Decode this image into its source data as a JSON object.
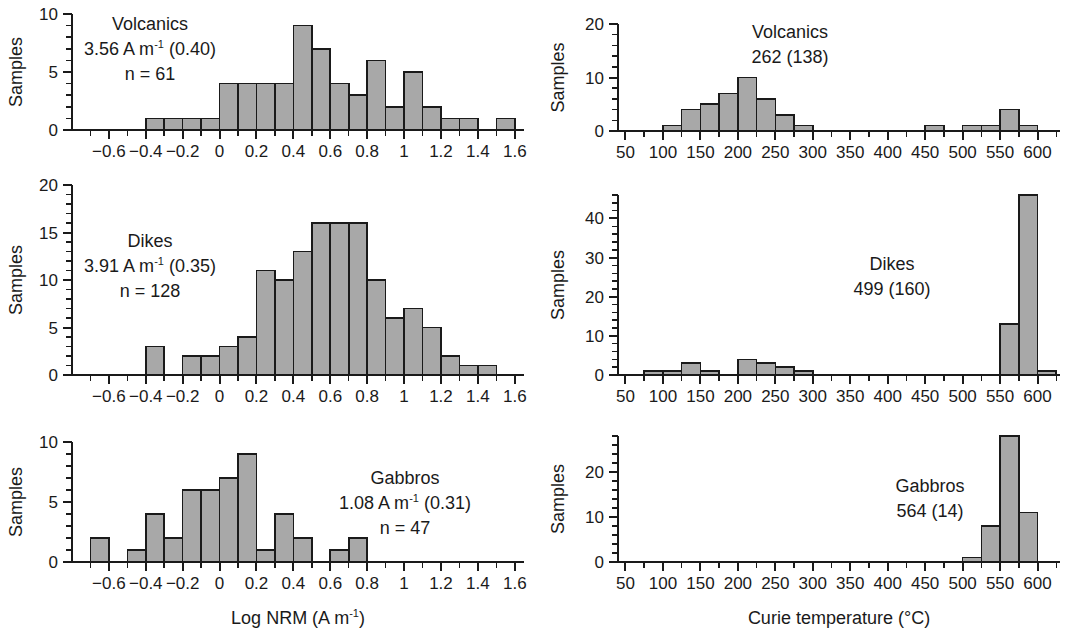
{
  "figure": {
    "background_color": "#ffffff",
    "bar_fill_color": "#a8a8a8",
    "bar_stroke_color": "#1a1a1a",
    "axis_color": "#1a1a1a"
  },
  "axis_titles": {
    "left_column": "Log NRM (A m",
    "left_column_sup": "-1",
    "left_column_tail": ")",
    "right_column": "Curie temperature (°C)",
    "y_axis": "Samples"
  },
  "chart_data": [
    {
      "id": "volcanics-nrm",
      "type": "bar",
      "title": "",
      "xlabel": "Log NRM (A m-1)",
      "ylabel": "Samples",
      "xlim": [
        -0.8,
        1.65
      ],
      "ylim": [
        0,
        10
      ],
      "yticks": [
        0,
        5,
        10
      ],
      "ytick_labels": [
        "0",
        "5",
        "10"
      ],
      "xticks": [
        -0.6,
        -0.4,
        -0.2,
        0,
        0.2,
        0.4,
        0.6,
        0.8,
        1.0,
        1.2,
        1.4,
        1.6
      ],
      "xtick_labels": [
        "−0.6",
        "−0.4",
        "−0.2",
        "0",
        "0.2",
        "0.4",
        "0.6",
        "0.8",
        "1",
        "1.2",
        "1.4",
        "1.6"
      ],
      "minor_tick_step": 0.1,
      "bin_width": 0.1,
      "bin_starts": [
        -0.4,
        -0.3,
        -0.2,
        -0.1,
        0.0,
        0.1,
        0.2,
        0.3,
        0.4,
        0.5,
        0.6,
        0.7,
        0.8,
        0.9,
        1.0,
        1.1,
        1.2,
        1.3,
        1.5
      ],
      "values": [
        1,
        1,
        1,
        1,
        4,
        4,
        4,
        4,
        9,
        7,
        4,
        3,
        6,
        2,
        5,
        2,
        1,
        1,
        1
      ],
      "annotation": {
        "line1": "Volcanics",
        "line2_pre": "3.56 A m",
        "line2_sup": "-1",
        "line2_post": " (0.40)",
        "line3": "n = 61"
      },
      "grid": false,
      "legend": "none"
    },
    {
      "id": "volcanics-curie",
      "type": "bar",
      "title": "",
      "xlabel": "Curie temperature (°C)",
      "ylabel": "Samples",
      "xlim": [
        40,
        630
      ],
      "ylim": [
        0,
        20
      ],
      "yticks": [
        0,
        10,
        20
      ],
      "ytick_labels": [
        "0",
        "10",
        "20"
      ],
      "xticks": [
        50,
        100,
        150,
        200,
        250,
        300,
        350,
        400,
        450,
        500,
        550,
        600
      ],
      "xtick_labels": [
        "50",
        "100",
        "150",
        "200",
        "250",
        "300",
        "350",
        "400",
        "450",
        "500",
        "550",
        "600"
      ],
      "minor_tick_step": 25,
      "bin_width": 25,
      "bin_starts": [
        100,
        125,
        150,
        175,
        200,
        225,
        250,
        275,
        450,
        500,
        525,
        550,
        575
      ],
      "values": [
        1,
        4,
        5,
        7,
        10,
        6,
        3,
        1,
        1,
        1,
        1,
        4,
        1
      ],
      "annotation": {
        "line1": "Volcanics",
        "line2": "262 (138)"
      },
      "grid": false,
      "legend": "none"
    },
    {
      "id": "dikes-nrm",
      "type": "bar",
      "title": "",
      "xlabel": "Log NRM (A m-1)",
      "ylabel": "Samples",
      "xlim": [
        -0.8,
        1.65
      ],
      "ylim": [
        0,
        20
      ],
      "yticks": [
        0,
        5,
        10,
        15,
        20
      ],
      "ytick_labels": [
        "0",
        "5",
        "10",
        "15",
        "20"
      ],
      "xticks": [
        -0.6,
        -0.4,
        -0.2,
        0,
        0.2,
        0.4,
        0.6,
        0.8,
        1.0,
        1.2,
        1.4,
        1.6
      ],
      "xtick_labels": [
        "−0.6",
        "−0.4",
        "−0.2",
        "0",
        "0.2",
        "0.4",
        "0.6",
        "0.8",
        "1",
        "1.2",
        "1.4",
        "1.6"
      ],
      "minor_tick_step": 0.1,
      "bin_width": 0.1,
      "bin_starts": [
        -0.4,
        -0.2,
        -0.1,
        0.0,
        0.1,
        0.2,
        0.3,
        0.4,
        0.5,
        0.6,
        0.7,
        0.8,
        0.9,
        1.0,
        1.1,
        1.2,
        1.3,
        1.4
      ],
      "values": [
        3,
        2,
        2,
        3,
        4,
        11,
        10,
        13,
        16,
        16,
        16,
        10,
        6,
        7,
        5,
        2,
        1,
        1
      ],
      "annotation": {
        "line1": "Dikes",
        "line2_pre": "3.91 A m",
        "line2_sup": "-1",
        "line2_post": " (0.35)",
        "line3": "n = 128"
      },
      "grid": false,
      "legend": "none"
    },
    {
      "id": "dikes-curie",
      "type": "bar",
      "title": "",
      "xlabel": "Curie temperature (°C)",
      "ylabel": "Samples",
      "xlim": [
        40,
        630
      ],
      "ylim": [
        0,
        46
      ],
      "yticks": [
        0,
        10,
        20,
        30,
        40
      ],
      "ytick_labels": [
        "0",
        "10",
        "20",
        "30",
        "40"
      ],
      "xticks": [
        50,
        100,
        150,
        200,
        250,
        300,
        350,
        400,
        450,
        500,
        550,
        600
      ],
      "xtick_labels": [
        "50",
        "100",
        "150",
        "200",
        "250",
        "300",
        "350",
        "400",
        "450",
        "500",
        "550",
        "600"
      ],
      "minor_tick_step": 25,
      "bin_width": 25,
      "bin_starts": [
        75,
        100,
        125,
        150,
        200,
        225,
        250,
        275,
        550,
        575,
        600
      ],
      "values": [
        1,
        1,
        3,
        1,
        4,
        3,
        2,
        1,
        13,
        46,
        1
      ],
      "annotation": {
        "line1": "Dikes",
        "line2": "499 (160)"
      },
      "grid": false,
      "legend": "none"
    },
    {
      "id": "gabbros-nrm",
      "type": "bar",
      "title": "",
      "xlabel": "Log NRM (A m-1)",
      "ylabel": "Samples",
      "xlim": [
        -0.8,
        1.65
      ],
      "ylim": [
        0,
        10
      ],
      "yticks": [
        0,
        5,
        10
      ],
      "ytick_labels": [
        "0",
        "5",
        "10"
      ],
      "xticks": [
        -0.6,
        -0.4,
        -0.2,
        0,
        0.2,
        0.4,
        0.6,
        0.8,
        1.0,
        1.2,
        1.4,
        1.6
      ],
      "xtick_labels": [
        "−0.6",
        "−0.4",
        "−0.2",
        "0",
        "0.2",
        "0.4",
        "0.6",
        "0.8",
        "1",
        "1.2",
        "1.4",
        "1.6"
      ],
      "minor_tick_step": 0.1,
      "bin_width": 0.1,
      "bin_starts": [
        -0.7,
        -0.5,
        -0.4,
        -0.3,
        -0.2,
        -0.1,
        0.0,
        0.1,
        0.2,
        0.3,
        0.4,
        0.6,
        0.7
      ],
      "values": [
        2,
        1,
        4,
        2,
        6,
        6,
        7,
        9,
        1,
        4,
        2,
        1,
        2
      ],
      "annotation": {
        "line1": "Gabbros",
        "line2_pre": "1.08 A m",
        "line2_sup": "-1",
        "line2_post": " (0.31)",
        "line3": "n = 47"
      },
      "grid": false,
      "legend": "none"
    },
    {
      "id": "gabbros-curie",
      "type": "bar",
      "title": "",
      "xlabel": "Curie temperature (°C)",
      "ylabel": "Samples",
      "xlim": [
        40,
        630
      ],
      "ylim": [
        0,
        28
      ],
      "yticks": [
        0,
        10,
        20
      ],
      "ytick_labels": [
        "0",
        "10",
        "20"
      ],
      "xticks": [
        50,
        100,
        150,
        200,
        250,
        300,
        350,
        400,
        450,
        500,
        550,
        600
      ],
      "xtick_labels": [
        "50",
        "100",
        "150",
        "200",
        "250",
        "300",
        "350",
        "400",
        "450",
        "500",
        "550",
        "600"
      ],
      "minor_tick_step": 25,
      "bin_width": 25,
      "bin_starts": [
        500,
        525,
        550,
        575
      ],
      "values": [
        1,
        8,
        28,
        11
      ],
      "annotation": {
        "line1": "Gabbros",
        "line2": "564 (14)"
      },
      "grid": false,
      "legend": "none"
    }
  ]
}
